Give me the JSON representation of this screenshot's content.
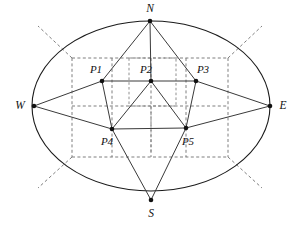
{
  "figure": {
    "canvas": {
      "width": 295,
      "height": 230,
      "background": "#ffffff"
    },
    "colors": {
      "ellipse_stroke": "#1b1b1b",
      "solid_edge": "#3a3a3a",
      "dashed_grid": "#6f6f6f",
      "vertex_fill": "#111111",
      "label_text": "#111111"
    }
  },
  "ellipse": {
    "name": "outer-ellipse",
    "cx": 151,
    "cy": 106,
    "rx": 119,
    "ry": 85
  },
  "cardinal_points": [
    {
      "id": "N",
      "label": "N",
      "x": 150,
      "y": 21,
      "label_x": 150,
      "label_y": 9,
      "anchor": "middle"
    },
    {
      "id": "S",
      "label": "S",
      "x": 151,
      "y": 200,
      "label_x": 151,
      "label_y": 214,
      "anchor": "middle"
    },
    {
      "id": "W",
      "label": "W",
      "x": 34,
      "y": 106,
      "label_x": 20,
      "label_y": 106,
      "anchor": "middle"
    },
    {
      "id": "E",
      "label": "E",
      "x": 270,
      "y": 106,
      "label_x": 283,
      "label_y": 106,
      "anchor": "middle"
    }
  ],
  "pentagon_points": [
    {
      "id": "P1",
      "label": "P1",
      "x": 102,
      "y": 81,
      "label_x": 96,
      "label_y": 70,
      "anchor": "middle"
    },
    {
      "id": "P2",
      "label": "P2",
      "x": 151,
      "y": 81,
      "label_x": 146,
      "label_y": 70,
      "anchor": "middle"
    },
    {
      "id": "P3",
      "label": "P3",
      "x": 196,
      "y": 81,
      "label_x": 203,
      "label_y": 70,
      "anchor": "middle"
    },
    {
      "id": "P4",
      "label": "P4",
      "x": 112,
      "y": 129,
      "label_x": 107,
      "label_y": 142,
      "anchor": "middle"
    },
    {
      "id": "P5",
      "label": "P5",
      "x": 186,
      "y": 128,
      "label_x": 188,
      "label_y": 142,
      "anchor": "middle"
    }
  ],
  "solid_edges": [
    {
      "name": "edge-N-P1",
      "from": "N",
      "to": "P1"
    },
    {
      "name": "edge-N-P2",
      "from": "N",
      "to": "P2"
    },
    {
      "name": "edge-N-P3",
      "from": "N",
      "to": "P3"
    },
    {
      "name": "edge-W-P1",
      "from": "W",
      "to": "P1"
    },
    {
      "name": "edge-W-P4",
      "from": "W",
      "to": "P4"
    },
    {
      "name": "edge-E-P3",
      "from": "E",
      "to": "P3"
    },
    {
      "name": "edge-E-P5",
      "from": "E",
      "to": "P5"
    },
    {
      "name": "edge-S-P4",
      "from": "S",
      "to": "P4"
    },
    {
      "name": "edge-S-P5",
      "from": "S",
      "to": "P5"
    },
    {
      "name": "edge-P1-P2",
      "from": "P1",
      "to": "P2"
    },
    {
      "name": "edge-P2-P3",
      "from": "P2",
      "to": "P3"
    },
    {
      "name": "edge-P1-P4",
      "from": "P1",
      "to": "P4"
    },
    {
      "name": "edge-P3-P5",
      "from": "P3",
      "to": "P5"
    },
    {
      "name": "edge-P4-P5",
      "from": "P4",
      "to": "P5"
    },
    {
      "name": "edge-P2-P4",
      "from": "P2",
      "to": "P4"
    },
    {
      "name": "edge-P2-P5",
      "from": "P2",
      "to": "P5"
    }
  ],
  "dashed_grid": {
    "outer_rect": {
      "name": "grid-outer-rect",
      "x1": 72,
      "y1": 58,
      "x2": 228,
      "y2": 157
    },
    "vertical_lines": [
      {
        "name": "grid-v-left",
        "x": 72,
        "y1": 58,
        "y2": 157
      },
      {
        "name": "grid-v-inner-left",
        "x": 112,
        "y1": 58,
        "y2": 157
      },
      {
        "name": "grid-v-center",
        "x": 151,
        "y1": 58,
        "y2": 157
      },
      {
        "name": "grid-v-inner-right",
        "x": 186,
        "y1": 58,
        "y2": 157
      },
      {
        "name": "grid-v-right",
        "x": 228,
        "y1": 58,
        "y2": 157
      }
    ],
    "horizontal_lines": [
      {
        "name": "grid-h-top",
        "y": 58,
        "x1": 72,
        "x2": 228
      },
      {
        "name": "grid-h-middle",
        "y": 106,
        "x1": 72,
        "x2": 228
      },
      {
        "name": "grid-h-bottom",
        "y": 157,
        "x1": 72,
        "x2": 228
      }
    ],
    "inner_box": {
      "name": "grid-inner-box",
      "x1": 129,
      "y1": 58,
      "x2": 176,
      "y2": 106
    },
    "p2_stub": {
      "name": "grid-v-center-stub",
      "x": 151,
      "y1": 106,
      "y2": 152
    }
  },
  "diagonal_rays": [
    {
      "name": "ray-northwest",
      "x1": 72,
      "y1": 58,
      "x2": 38,
      "y2": 26
    },
    {
      "name": "ray-northeast",
      "x1": 228,
      "y1": 58,
      "x2": 262,
      "y2": 26
    },
    {
      "name": "ray-southwest",
      "x1": 72,
      "y1": 157,
      "x2": 38,
      "y2": 188
    },
    {
      "name": "ray-southeast",
      "x1": 228,
      "y1": 157,
      "x2": 262,
      "y2": 188
    }
  ]
}
